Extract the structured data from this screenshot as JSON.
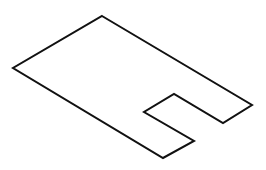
{
  "diagram": {
    "type": "isometric-outline",
    "stroke_color": "#111111",
    "background": "#ffffff",
    "stroke_width": 2,
    "points": "102,16 252,105 223,123 174,94 144,112 194,141 163,158 13,68"
  }
}
